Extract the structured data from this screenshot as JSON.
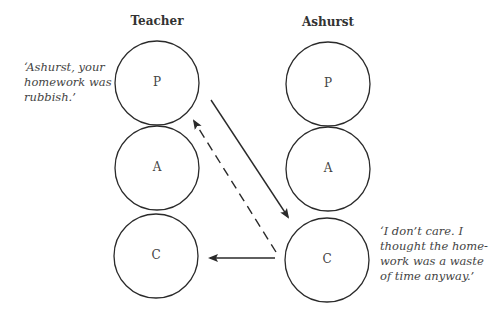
{
  "diagram": {
    "type": "transactional-analysis-crossed-transaction",
    "columns": [
      {
        "title": "Teacher",
        "states": [
          "P",
          "A",
          "C"
        ]
      },
      {
        "title": "Ashurst",
        "states": [
          "P",
          "A",
          "C"
        ]
      }
    ],
    "quotes": {
      "teacher": "‘Ashurst, your\nhomework was\nrubbish.’",
      "ashurst": "‘I don’t care. I\nthought the home-\nwork was a waste\nof time anyway.’"
    },
    "arrows": [
      {
        "from": "Teacher.P",
        "to": "Ashurst.C",
        "style": "solid"
      },
      {
        "from": "Ashurst.C",
        "to": "Teacher.P",
        "style": "dashed"
      },
      {
        "from": "Ashurst.C",
        "to": "Teacher.C",
        "style": "solid"
      }
    ],
    "colors": {
      "stroke": "#2a2a2a",
      "text": "#444444",
      "background": "#ffffff"
    }
  }
}
